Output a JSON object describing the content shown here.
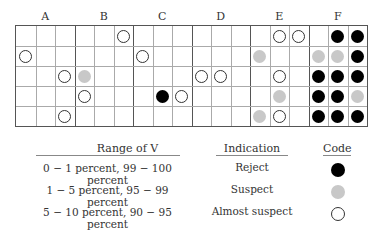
{
  "columns": [
    "A",
    "B",
    "C",
    "D",
    "E",
    "F"
  ],
  "grid": {
    "cols_per_group": 3,
    "rows": 5
  },
  "markers": [
    {
      "row": 0,
      "col": 5,
      "code": "almost"
    },
    {
      "row": 0,
      "col": 13,
      "code": "almost"
    },
    {
      "row": 0,
      "col": 14,
      "code": "almost"
    },
    {
      "row": 0,
      "col": 16,
      "code": "reject"
    },
    {
      "row": 0,
      "col": 17,
      "code": "reject"
    },
    {
      "row": 1,
      "col": 0,
      "code": "almost"
    },
    {
      "row": 1,
      "col": 6,
      "code": "almost"
    },
    {
      "row": 1,
      "col": 12,
      "code": "suspect"
    },
    {
      "row": 1,
      "col": 15,
      "code": "suspect"
    },
    {
      "row": 1,
      "col": 16,
      "code": "suspect"
    },
    {
      "row": 1,
      "col": 17,
      "code": "reject"
    },
    {
      "row": 2,
      "col": 2,
      "code": "almost"
    },
    {
      "row": 2,
      "col": 3,
      "code": "suspect"
    },
    {
      "row": 2,
      "col": 9,
      "code": "almost"
    },
    {
      "row": 2,
      "col": 10,
      "code": "almost"
    },
    {
      "row": 2,
      "col": 13,
      "code": "almost"
    },
    {
      "row": 2,
      "col": 15,
      "code": "reject"
    },
    {
      "row": 2,
      "col": 16,
      "code": "reject"
    },
    {
      "row": 2,
      "col": 17,
      "code": "reject"
    },
    {
      "row": 3,
      "col": 3,
      "code": "almost"
    },
    {
      "row": 3,
      "col": 7,
      "code": "reject"
    },
    {
      "row": 3,
      "col": 8,
      "code": "almost"
    },
    {
      "row": 3,
      "col": 13,
      "code": "suspect"
    },
    {
      "row": 3,
      "col": 15,
      "code": "reject"
    },
    {
      "row": 3,
      "col": 16,
      "code": "reject"
    },
    {
      "row": 3,
      "col": 17,
      "code": "suspect"
    },
    {
      "row": 4,
      "col": 2,
      "code": "almost"
    },
    {
      "row": 4,
      "col": 12,
      "code": "suspect"
    },
    {
      "row": 4,
      "col": 13,
      "code": "almost"
    },
    {
      "row": 4,
      "col": 15,
      "code": "reject"
    },
    {
      "row": 4,
      "col": 16,
      "code": "reject"
    },
    {
      "row": 4,
      "col": 17,
      "code": "reject"
    }
  ],
  "legend": {
    "headers": {
      "range": "Range of V",
      "indication": "Indication",
      "code": "Code"
    },
    "rows": [
      {
        "range": "0 − 1 percent, 99 − 100 percent",
        "indication": "Reject",
        "code": "reject"
      },
      {
        "range": "1 − 5 percent, 95 − 99 percent",
        "indication": "Suspect",
        "code": "suspect"
      },
      {
        "range": "5 − 10 percent, 90 − 95 percent",
        "indication": "Almost suspect",
        "code": "almost"
      }
    ]
  },
  "colors": {
    "reject": "#000000",
    "suspect": "#c8c8c8",
    "almost": "#ffffff"
  }
}
